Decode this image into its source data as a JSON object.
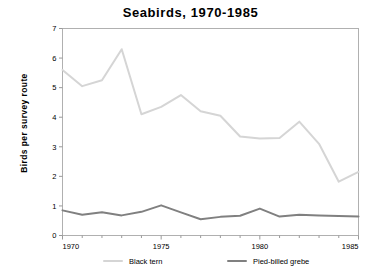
{
  "chart_data": {
    "type": "line",
    "title": "Seabirds, 1970-1985",
    "xlabel": "",
    "ylabel": "Birds per survey route",
    "x": [
      1970,
      1971,
      1972,
      1973,
      1974,
      1975,
      1976,
      1977,
      1978,
      1979,
      1980,
      1981,
      1982,
      1983,
      1984,
      1985
    ],
    "xlim": [
      1970,
      1985
    ],
    "ylim": [
      0,
      7
    ],
    "ytick_labels": [
      "0",
      "1",
      "2",
      "3",
      "4",
      "5",
      "6",
      "7"
    ],
    "yticks": [
      0,
      1,
      2,
      3,
      4,
      5,
      6,
      7
    ],
    "xtick_labels": [
      "1970",
      "1975",
      "1980",
      "1985"
    ],
    "xticks": [
      1970,
      1975,
      1980,
      1985
    ],
    "xminor_ticks": [
      1971,
      1972,
      1973,
      1974,
      1976,
      1977,
      1978,
      1979,
      1981,
      1982,
      1983,
      1984
    ],
    "grid": false,
    "legend_position": "bottom",
    "series": [
      {
        "name": "Black tern",
        "color": "#d5d5d5",
        "values": [
          5.6,
          5.05,
          5.25,
          6.3,
          4.1,
          4.35,
          4.75,
          4.2,
          4.05,
          3.35,
          3.28,
          3.3,
          3.85,
          3.1,
          1.82,
          2.15
        ]
      },
      {
        "name": "Pied-billed grebe",
        "color": "#808080",
        "values": [
          0.85,
          0.7,
          0.79,
          0.68,
          0.8,
          1.02,
          0.78,
          0.55,
          0.63,
          0.67,
          0.91,
          0.64,
          0.7,
          0.68,
          0.66,
          0.64
        ]
      }
    ]
  },
  "legend": {
    "items": [
      {
        "label": "Black tern",
        "color": "#d5d5d5"
      },
      {
        "label": "Pied-billed grebe",
        "color": "#808080"
      }
    ]
  },
  "axes": {
    "frame_color": "#b0b0b0",
    "tick_color": "#9a9a9a"
  }
}
